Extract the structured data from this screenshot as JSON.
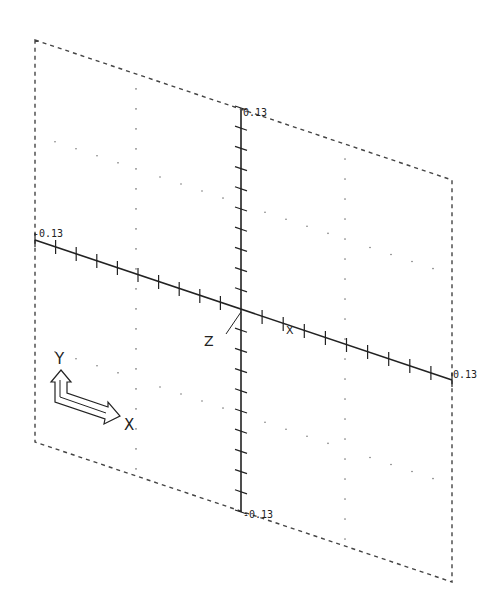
{
  "viewport": {
    "plane": {
      "tl": [
        35,
        40
      ],
      "tr": [
        452,
        180
      ],
      "br": [
        452,
        582
      ],
      "bl": [
        35,
        442
      ]
    },
    "origin": [
      241,
      310
    ],
    "y_axis": {
      "top": [
        241,
        110
      ],
      "bottom": [
        241,
        512
      ]
    },
    "x_axis": {
      "left": [
        35,
        240
      ],
      "right": [
        452,
        380
      ]
    },
    "tick_count_per_half": 10
  },
  "labels": {
    "y_max": "0.13",
    "y_min": "-0.13",
    "x_min": "-0.13",
    "x_max": "0.13",
    "z_axis": "Z",
    "x_marker": "X"
  },
  "ucs_icon": {
    "y_label": "Y",
    "x_label": "X"
  },
  "colors": {
    "line": "#222222",
    "dash": "#444444",
    "dot": "#777777"
  }
}
